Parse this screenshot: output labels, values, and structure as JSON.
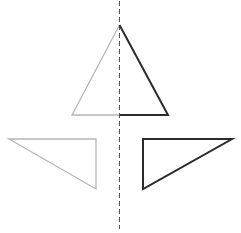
{
  "diagram": {
    "axis": {
      "x": 119.5,
      "y1": 1,
      "y2": 229,
      "dash": "5,3",
      "color": "#555555",
      "width": 1
    },
    "colors": {
      "light": "#b5b5b5",
      "dark": "#2b2b2b"
    },
    "top_triangle": {
      "left_half": {
        "points": "119.5,25 72,115 119.5,115",
        "style": "light"
      },
      "right_half": {
        "points": "119.5,25 168,115 119.5,115",
        "style": "dark"
      }
    },
    "bottom_left_triangle": {
      "points": "9,139 96,139 96,189",
      "style": "light"
    },
    "bottom_right_triangle": {
      "points": "143,139 232,139 143,189",
      "style": "dark"
    }
  }
}
